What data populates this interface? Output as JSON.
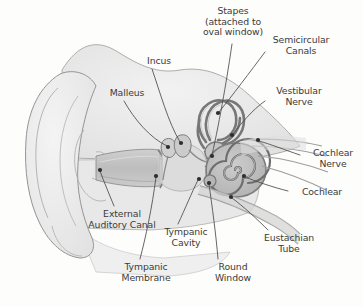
{
  "figure": {
    "background_color": "#fdfdfc",
    "text_color": "#3b3b3b",
    "line_color": "#4a4a4a"
  },
  "palette": {
    "outline": "#8e8e8e",
    "pinna_fill": "#ededed",
    "head_fill": "#e4e4e4",
    "canal_fill": "#c9c9c9",
    "bone_fill": "#d6d6d6",
    "cochlea_fill": "#bdbdbd",
    "labyrinth_stroke": "#7a7a7a",
    "dot_color": "#2e2e2e"
  },
  "labels": [
    {
      "id": "stapes",
      "text": "Stapes\n(attached to\noval window)",
      "x": 187,
      "y": 6,
      "w": 92,
      "align": "center"
    },
    {
      "id": "semicircular-canals",
      "text": "Semicircular\nCanals",
      "x": 258,
      "y": 35,
      "w": 86,
      "align": "center"
    },
    {
      "id": "incus",
      "text": "Incus",
      "x": 136,
      "y": 56,
      "w": 46,
      "align": "center"
    },
    {
      "id": "vestibular-nerve",
      "text": "Vestibular\nNerve",
      "x": 262,
      "y": 86,
      "w": 74,
      "align": "center"
    },
    {
      "id": "malleus",
      "text": "Malleus",
      "x": 100,
      "y": 88,
      "w": 54,
      "align": "center"
    },
    {
      "id": "cochlear-nerve",
      "text": "Cochlear\nNerve",
      "x": 303,
      "y": 148,
      "w": 60,
      "align": "center"
    },
    {
      "id": "cochlear",
      "text": "Cochlear",
      "x": 291,
      "y": 187,
      "w": 62,
      "align": "center"
    },
    {
      "id": "external-auditory-canal",
      "text": "External\nAuditory Canal",
      "x": 73,
      "y": 209,
      "w": 98,
      "align": "center"
    },
    {
      "id": "tympanic-cavity",
      "text": "Tympanic\nCavity",
      "x": 155,
      "y": 227,
      "w": 62,
      "align": "center"
    },
    {
      "id": "eustachian-tube",
      "text": "Eustachian\nTube",
      "x": 253,
      "y": 233,
      "w": 72,
      "align": "center"
    },
    {
      "id": "tympanic-membrane",
      "text": "Tympanic\nMembrane",
      "x": 110,
      "y": 262,
      "w": 72,
      "align": "center"
    },
    {
      "id": "round-window",
      "text": "Round\nWindow",
      "x": 205,
      "y": 262,
      "w": 56,
      "align": "center"
    }
  ],
  "leaders": [
    {
      "id": "leader-stapes",
      "path": "M 232 44 C 228 72, 220 120, 212 155",
      "dot": [
        212,
        156
      ]
    },
    {
      "id": "leader-semicircular-canals",
      "path": "M 265 52 C 250 72, 232 96, 219 112",
      "dot": [
        218,
        113
      ]
    },
    {
      "id": "leader-incus",
      "path": "M 152 69 C 160 92, 168 122, 180 142",
      "dot": [
        181,
        143
      ]
    },
    {
      "id": "leader-vestibular-nerve",
      "path": "M 265 101 C 252 110, 240 125, 233 134",
      "dot": [
        232,
        135
      ]
    },
    {
      "id": "leader-malleus",
      "path": "M 124 101 C 134 119, 150 138, 167 146",
      "dot": [
        168,
        147
      ]
    },
    {
      "id": "leader-cochlear-nerve",
      "path": "M 300 155 C 285 150, 270 144, 259 141",
      "dot": [
        258,
        140
      ]
    },
    {
      "id": "leader-cochlear",
      "path": "M 288 191 C 272 187, 255 181, 245 177",
      "dot": [
        244,
        176
      ]
    },
    {
      "id": "leader-external-auditory-canal",
      "path": "M 114 206 C 110 196, 104 182, 100 171",
      "dot": [
        100,
        170
      ]
    },
    {
      "id": "leader-tympanic-cavity",
      "path": "M 178 224 C 185 209, 192 192, 198 180",
      "dot": [
        199,
        179
      ]
    },
    {
      "id": "leader-eustachian-tube",
      "path": "M 268 230 C 258 220, 243 206, 232 198",
      "dot": [
        231,
        197
      ]
    },
    {
      "id": "leader-tympanic-membrane",
      "path": "M 140 259 C 146 236, 152 208, 156 177",
      "dot": [
        156,
        176
      ]
    },
    {
      "id": "leader-round-window",
      "path": "M 218 259 C 216 234, 212 206, 209 184",
      "dot": [
        209,
        183
      ]
    }
  ],
  "structures": [
    {
      "id": "pinna",
      "name": "pinna-auricle"
    },
    {
      "id": "external-auditory-canal",
      "name": "ear-canal"
    },
    {
      "id": "tympanic-membrane",
      "name": "eardrum"
    },
    {
      "id": "ossicles",
      "name": "malleus-incus-stapes"
    },
    {
      "id": "semicircular-canals",
      "name": "semicircular-canals"
    },
    {
      "id": "cochlea",
      "name": "cochlea-spiral"
    },
    {
      "id": "vestibulocochlear-nerve",
      "name": "nerve-bundle"
    },
    {
      "id": "eustachian-tube",
      "name": "eustachian-tube"
    }
  ]
}
